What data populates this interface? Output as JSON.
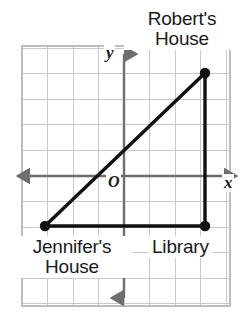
{
  "figure": {
    "type": "coordinate-grid-diagram",
    "background_color": "#ffffff"
  },
  "axes": {
    "x_label": "x",
    "y_label": "y",
    "origin_label": "O",
    "axis_color": "#6e6e6e",
    "grid_color": "#c9c9c9",
    "grid_spacing_px": 25.5,
    "x_axis_y_px": 176,
    "y_axis_x_px": 124,
    "grid_bounds_px": {
      "left": 22,
      "top": 46,
      "right": 230,
      "bottom": 306
    },
    "x_range_units": [
      -4,
      4
    ],
    "y_range_units": [
      -5,
      5
    ]
  },
  "points": [
    {
      "id": "roberts-house",
      "label_line1": "Robert's",
      "label_line2": "House",
      "x_units": 3,
      "y_units": 4,
      "px": {
        "x": 205,
        "y": 73
      },
      "marker_color": "#111111"
    },
    {
      "id": "jennifers-house",
      "label_line1": "Jennifer's",
      "label_line2": "House",
      "x_units": -3,
      "y_units": -2,
      "px": {
        "x": 45,
        "y": 226
      },
      "marker_color": "#111111"
    },
    {
      "id": "library",
      "label_line1": "Library",
      "label_line2": "",
      "x_units": 3,
      "y_units": -2,
      "px": {
        "x": 205,
        "y": 226
      },
      "marker_color": "#111111"
    }
  ],
  "segments": [
    {
      "id": "hypotenuse",
      "from": "jennifers-house",
      "to": "roberts-house",
      "color": "#111111"
    },
    {
      "id": "base",
      "from": "jennifers-house",
      "to": "library",
      "color": "#111111"
    },
    {
      "id": "vertical-leg",
      "from": "library",
      "to": "roberts-house",
      "color": "#111111"
    }
  ],
  "colors": {
    "ink": "#111111",
    "axis": "#6e6e6e",
    "grid": "#c9c9c9",
    "text": "#1a1a1a",
    "page": "#ffffff"
  }
}
